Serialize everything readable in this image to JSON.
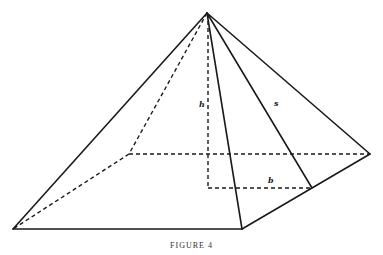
{
  "figure": {
    "caption": "FIGURE 4",
    "labels": {
      "height": "h",
      "slant_height": "s",
      "half_base": "b"
    },
    "colors": {
      "line": "#1a1a1a",
      "background": "#ffffff"
    }
  }
}
